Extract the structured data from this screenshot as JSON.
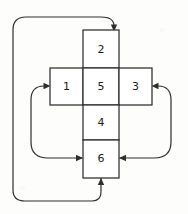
{
  "diagram": {
    "type": "flowchart-cross",
    "background_color": "#fdfdfc",
    "line_color": "#2e2e2e",
    "box_fill": "#ffffff",
    "boxes": [
      {
        "id": "box-top",
        "label": "2",
        "x": 83,
        "y": 30,
        "w": 36,
        "h": 38
      },
      {
        "id": "box-middle-left",
        "label": "1",
        "x": 50,
        "y": 68,
        "w": 33,
        "h": 37
      },
      {
        "id": "box-center",
        "label": "5",
        "x": 83,
        "y": 68,
        "w": 36,
        "h": 37
      },
      {
        "id": "box-middle-right",
        "label": "3",
        "x": 119,
        "y": 68,
        "w": 33,
        "h": 37
      },
      {
        "id": "box-below-center",
        "label": "4",
        "x": 83,
        "y": 105,
        "w": 36,
        "h": 35
      },
      {
        "id": "box-bottom",
        "label": "6",
        "x": 83,
        "y": 140,
        "w": 36,
        "h": 38
      }
    ],
    "connectors": [
      {
        "id": "loop-outer-top",
        "from": "box-bottom",
        "to": "box-top",
        "side": "left-around-to-top"
      },
      {
        "id": "loop-left",
        "from": "box-bottom-left",
        "to": "box-middle-left",
        "side": "left"
      },
      {
        "id": "loop-right",
        "from": "box-bottom-right",
        "to": "box-middle-right",
        "side": "right"
      },
      {
        "id": "loop-bottom-left",
        "from": "loop-left-path",
        "to": "box-bottom",
        "side": "bottom-left"
      },
      {
        "id": "loop-bottom-right",
        "from": "loop-right-path",
        "to": "box-bottom",
        "side": "bottom-right"
      }
    ]
  }
}
